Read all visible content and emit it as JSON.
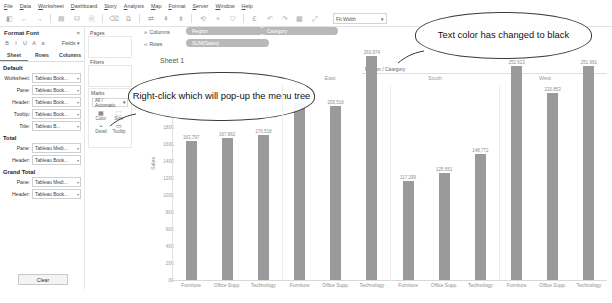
{
  "menu": {
    "items": [
      "File",
      "Data",
      "Worksheet",
      "Dashboard",
      "Story",
      "Analysis",
      "Map",
      "Format",
      "Server",
      "Window",
      "Help"
    ]
  },
  "toolbar": {
    "icons": [
      "tableau-logo-icon",
      "back-arrow-icon",
      "forward-arrow-icon",
      "save-icon",
      "new-datasource-icon",
      "new-worksheet-icon",
      "duplicate-icon",
      "clear-sheet-icon",
      "sort-ascending-icon",
      "sort-descending-icon",
      "group-icon",
      "highlight-icon",
      "labels-icon",
      "presentation-icon",
      "fit-icon",
      "fix-axes-icon"
    ],
    "fit_value": "Fit Width",
    "fit_caret": "▾"
  },
  "format_panel": {
    "title": "Format Font",
    "close_label": "×",
    "font_tools": [
      "B",
      "I",
      "U",
      "A",
      "≡"
    ],
    "fields_label": "Fields ▾",
    "tabs": [
      {
        "label": "Sheet",
        "active": true
      },
      {
        "label": "Rows",
        "active": false
      },
      {
        "label": "Columns",
        "active": false
      }
    ],
    "sections": [
      {
        "heading": "Default",
        "rows": [
          {
            "label": "Worksheet:",
            "value": "Tableau Book..."
          },
          {
            "label": "Pane:",
            "value": "Tableau Book..."
          },
          {
            "label": "Header:",
            "value": "Tableau Book..."
          },
          {
            "label": "Tooltip:",
            "value": "Tableau Book..."
          },
          {
            "label": "Title:",
            "value": "Tableau B..."
          }
        ]
      },
      {
        "heading": "Total",
        "rows": [
          {
            "label": "Pane:",
            "value": "Tableau Medi..."
          },
          {
            "label": "Header:",
            "value": "Tableau Book..."
          }
        ]
      },
      {
        "heading": "Grand Total",
        "rows": [
          {
            "label": "Pane:",
            "value": "Tableau Medi..."
          },
          {
            "label": "Header:",
            "value": "Tableau Book..."
          }
        ]
      }
    ],
    "clear_button": "Clear"
  },
  "shelves": {
    "pages_label": "Pages",
    "filters_label": "Filters",
    "columns_label": "Columns",
    "rows_label": "Rows",
    "columns_pills": [
      "Region",
      "Category"
    ],
    "rows_pills": [
      "SUM(Sales)"
    ],
    "marks": {
      "title": "Marks",
      "type_value": "All / Automatic",
      "buttons": [
        {
          "icon": "color-icon",
          "glyph": "▦",
          "label": "Color"
        },
        {
          "icon": "size-icon",
          "glyph": "⬚",
          "label": "Size"
        },
        {
          "icon": "detail-icon",
          "glyph": "⌁",
          "label": "Detail"
        },
        {
          "icon": "tooltip-icon",
          "glyph": "▭",
          "label": "Tooltip"
        }
      ]
    }
  },
  "sheet": {
    "name": "Sheet 1",
    "header_label": "Region / Category"
  },
  "callouts": [
    {
      "id": "callout-left",
      "text": "Right-click which will pop-up the menu tree"
    },
    {
      "id": "callout-right",
      "text": "Text color has changed to black"
    }
  ],
  "chart_data": {
    "type": "bar",
    "title": "",
    "xlabel": "",
    "ylabel": "Sales",
    "ylim": [
      0,
      230000
    ],
    "grid": false,
    "legend": null,
    "group_label": "Region / Category",
    "groups": [
      "East",
      "South",
      "West"
    ],
    "categories": [
      "Furniture",
      "Office Supp.",
      "Technology"
    ],
    "bars": [
      {
        "group": "East",
        "category": "Furniture",
        "value": 163797,
        "label": "163,797"
      },
      {
        "group": "East",
        "category": "Office Supp.",
        "value": 167862,
        "label": "167,862"
      },
      {
        "group": "East",
        "category": "Technology",
        "value": 170518,
        "label": "170,518"
      },
      {
        "group": "East2",
        "category": "Furniture",
        "value": 208291,
        "label": "208,291"
      },
      {
        "group": "East2",
        "category": "Office Supp.",
        "value": 205516,
        "label": "205,516"
      },
      {
        "group": "East2",
        "category": "Technology",
        "value": 263974,
        "label": "263,974"
      },
      {
        "group": "South",
        "category": "Furniture",
        "value": 117299,
        "label": "117,299"
      },
      {
        "group": "South",
        "category": "Office Supp.",
        "value": 125651,
        "label": "125,651"
      },
      {
        "group": "South",
        "category": "Technology",
        "value": 148772,
        "label": "148,772"
      },
      {
        "group": "West",
        "category": "Furniture",
        "value": 252613,
        "label": "252,613"
      },
      {
        "group": "West",
        "category": "Office Supp.",
        "value": 220853,
        "label": "220,853"
      },
      {
        "group": "West",
        "category": "Technology",
        "value": 251991,
        "label": "251,991"
      }
    ],
    "yticks": [
      "220K",
      "200K",
      "180K",
      "160K",
      "140K",
      "120K",
      "100K",
      "80K",
      "60K",
      "40K",
      "20K",
      "0K"
    ],
    "ytick_values": [
      220000,
      200000,
      180000,
      160000,
      140000,
      120000,
      100000,
      80000,
      60000,
      40000,
      20000,
      0
    ],
    "bar_color": "#9a9a9a"
  }
}
